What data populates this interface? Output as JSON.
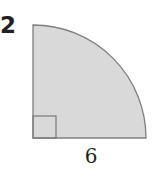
{
  "problem_number": "2",
  "figure": {
    "shape": "quarter-circle",
    "radius_label": "6",
    "fill_color": "#d9d9d9",
    "stroke_color": "#7f7f7f",
    "right_angle_marker": true
  }
}
